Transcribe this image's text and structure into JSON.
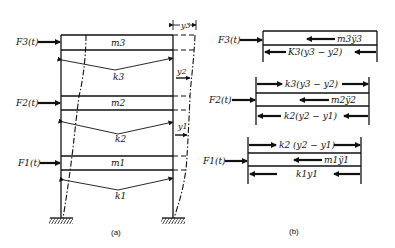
{
  "figure": {
    "panel_a": {
      "caption": "(a)",
      "forces": [
        "F3(t)",
        "F2(t)",
        "F1(t)"
      ],
      "masses": [
        "m3",
        "m2",
        "m1"
      ],
      "springs": [
        "k3",
        "k2",
        "k1"
      ],
      "displacements": [
        "y3",
        "y2",
        "y1"
      ]
    },
    "panel_b": {
      "caption": "(b)",
      "level3": {
        "force": "F3(t)",
        "inertia": "m3ÿ3",
        "spring_below": "K3(y3 − y2)"
      },
      "level2": {
        "force": "F2(t)",
        "spring_above": "k3(y3 − y2)",
        "inertia": "m2ÿ2",
        "spring_below": "k2(y2 − y1)"
      },
      "level1": {
        "force": "F1(t)",
        "spring_above": "k2 (y2 − y1)",
        "inertia": "m1ÿ1",
        "spring_below": "k1y1"
      }
    }
  }
}
